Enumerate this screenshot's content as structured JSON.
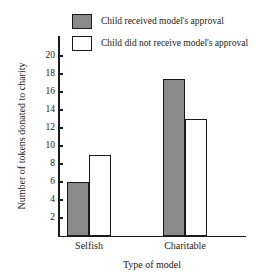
{
  "chart_data": {
    "type": "bar",
    "title": "",
    "xlabel": "Type of model",
    "ylabel": "Number of tokens donated to charity",
    "categories": [
      "Selfish",
      "Charitable"
    ],
    "series": [
      {
        "name": "Child received model's approval",
        "swatch": "filled",
        "color": "#8a8a8a",
        "values": [
          6,
          17.5
        ]
      },
      {
        "name": "Child did not receive model's approval",
        "swatch": "hollow",
        "color": "#ffffff",
        "values": [
          9,
          13
        ]
      }
    ],
    "ylim": [
      0,
      21
    ],
    "yticks": [
      2,
      4,
      6,
      8,
      10,
      12,
      14,
      16,
      18,
      20
    ],
    "ytick_labels": [
      "2",
      "4",
      "6",
      "8",
      "10",
      "12",
      "14",
      "16",
      "18",
      "20"
    ],
    "grid": false,
    "legend_position": "top-center",
    "outline_color": "#1a1a1a"
  }
}
